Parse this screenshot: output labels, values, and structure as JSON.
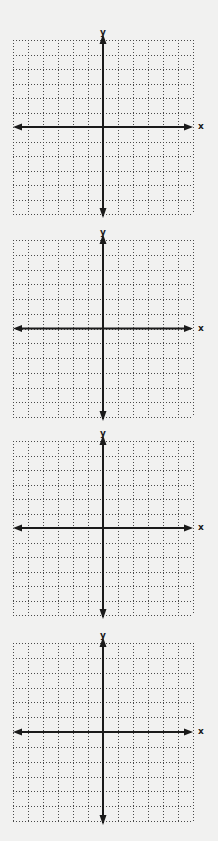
{
  "worksheet": {
    "planes": [
      {
        "id": 1,
        "x_label": "x",
        "y_label": "y",
        "top": 40,
        "bottom": 214,
        "label_top": 28
      },
      {
        "id": 2,
        "x_label": "x",
        "y_label": "y",
        "top": 240,
        "bottom": 417,
        "label_top": 228
      },
      {
        "id": 3,
        "x_label": "x",
        "y_label": "y",
        "top": 441,
        "bottom": 615,
        "label_top": 429
      },
      {
        "id": 4,
        "x_label": "x",
        "y_label": "y",
        "top": 643,
        "bottom": 821,
        "label_top": 631
      }
    ],
    "grid": {
      "columns": 12,
      "rows": 12,
      "left": 13,
      "right": 193,
      "y_axis_x": 103,
      "dot_color": "#4a4a4a",
      "axis_color": "#1a1a1a"
    }
  },
  "chart_data": [
    {
      "type": "coordinate_plane",
      "title": "",
      "xlabel": "x",
      "ylabel": "y",
      "grid": true,
      "gridlines_x": 12,
      "gridlines_y": 12,
      "xlim": [
        -6,
        6
      ],
      "ylim": [
        -6,
        6
      ],
      "series": []
    },
    {
      "type": "coordinate_plane",
      "title": "",
      "xlabel": "x",
      "ylabel": "y",
      "grid": true,
      "gridlines_x": 12,
      "gridlines_y": 12,
      "xlim": [
        -6,
        6
      ],
      "ylim": [
        -6,
        6
      ],
      "series": []
    },
    {
      "type": "coordinate_plane",
      "title": "",
      "xlabel": "x",
      "ylabel": "y",
      "grid": true,
      "gridlines_x": 12,
      "gridlines_y": 12,
      "xlim": [
        -6,
        6
      ],
      "ylim": [
        -6,
        6
      ],
      "series": []
    },
    {
      "type": "coordinate_plane",
      "title": "",
      "xlabel": "x",
      "ylabel": "y",
      "grid": true,
      "gridlines_x": 12,
      "gridlines_y": 12,
      "xlim": [
        -6,
        6
      ],
      "ylim": [
        -6,
        6
      ],
      "series": []
    }
  ]
}
